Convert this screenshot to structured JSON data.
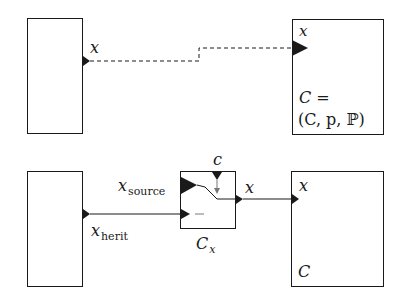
{
  "top_diagram": {
    "left_box": {
      "label": ""
    },
    "left_port_label": "x",
    "connection": {
      "style": "dashed",
      "from": "left_box",
      "to": "right_box"
    },
    "right_box": {
      "port_label": "x",
      "definition_line1": "C =",
      "definition_line2": "(C, p, ℙ)"
    }
  },
  "bottom_diagram": {
    "left_box": {
      "label": ""
    },
    "left_port_label_main": "x",
    "left_port_label_sub": "herit",
    "switch_box": {
      "source_label_main": "x",
      "source_label_sub": "source",
      "control_label": "c",
      "output_label": "x",
      "caption_main": "C",
      "caption_sub": "x",
      "inactive_input_mark": "—"
    },
    "right_box": {
      "port_label": "x",
      "name": "C"
    }
  },
  "colors": {
    "stroke": "#1a1a1a",
    "background": "#ffffff"
  }
}
